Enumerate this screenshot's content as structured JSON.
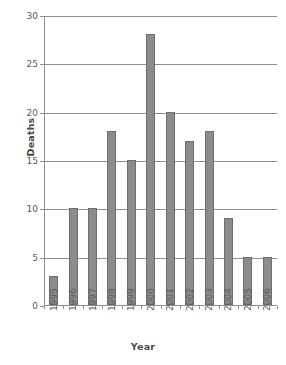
{
  "chart_data": {
    "type": "bar",
    "title": "",
    "xlabel": "Year",
    "ylabel": "Deaths",
    "categories": [
      "1995",
      "1996",
      "1997",
      "1998",
      "1999",
      "2000",
      "2001",
      "2002",
      "2003",
      "2004",
      "2005",
      "2006"
    ],
    "values": [
      3,
      10,
      10,
      18,
      15,
      28,
      20,
      17,
      18,
      9,
      5,
      5
    ],
    "ylim": [
      0,
      30
    ],
    "yticks": [
      0,
      5,
      10,
      15,
      20,
      25,
      30
    ],
    "ytick_labels": [
      "0",
      "5",
      "10",
      "15",
      "20",
      "25",
      "30"
    ],
    "grid": "horizontal",
    "legend": "none",
    "bar_color": "#8c8c8c",
    "bar_edge_color": "#6d6d6d",
    "grid_color": "#919191",
    "axis_color": "#8e8e8e",
    "background": "#ffffff"
  },
  "caption": {
    "text": ""
  }
}
